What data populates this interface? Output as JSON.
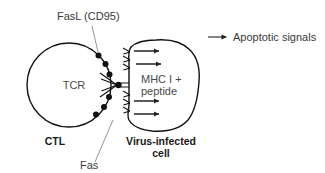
{
  "figure": {
    "type": "biology-diagram",
    "title_visible": false,
    "background_color": "#ffffff",
    "line_color": "#111111",
    "text_color": "#3a3a3a"
  },
  "labels": {
    "fasl": "FasL (CD95)",
    "fas": "Fas",
    "tcr": "TCR",
    "mhc_line1": "MHC I +",
    "mhc_line2": "peptide",
    "ctl": "CTL",
    "target_line1": "Virus-infected",
    "target_line2": "cell"
  },
  "legend": {
    "arrow_icon": "right-arrow-icon",
    "text": "Apoptotic signals"
  },
  "cells": [
    {
      "name": "CTL",
      "shape": "circle",
      "label": "CTL",
      "receptor_label": "TCR",
      "ligand_label": "FasL (CD95)",
      "ligand_count": 6
    },
    {
      "name": "Virus-infected cell",
      "shape": "irregular-blob",
      "label": "Virus-infected cell",
      "receptor_label": "Fas",
      "receptor_count": 6,
      "antigen_label": "MHC I + peptide"
    }
  ],
  "apoptotic_signal_arrows": {
    "count": 4,
    "direction": "right"
  }
}
